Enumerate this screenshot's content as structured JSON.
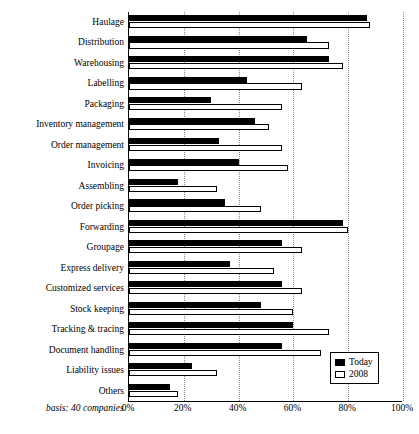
{
  "chart_data": {
    "type": "bar",
    "orientation": "horizontal",
    "title": "",
    "xlabel": "",
    "ylabel": "",
    "xlim": [
      0,
      100
    ],
    "xticks": [
      "0%",
      "20%",
      "40%",
      "60%",
      "80%",
      "100%"
    ],
    "xtick_values": [
      0,
      20,
      40,
      60,
      80,
      100
    ],
    "grid": "vertical dotted",
    "legend_position": "bottom-right",
    "categories": [
      "Haulage",
      "Distribution",
      "Warehousing",
      "Labelling",
      "Packaging",
      "Inventory management",
      "Order management",
      "Invoicing",
      "Assembling",
      "Order picking",
      "Forwarding",
      "Groupage",
      "Express delivery",
      "Customized services",
      "Stock keeping",
      "Tracking & tracing",
      "Document handling",
      "Liability issues",
      "Others"
    ],
    "series": [
      {
        "name": "Today",
        "values": [
          87,
          65,
          73,
          43,
          30,
          46,
          33,
          40,
          18,
          35,
          78,
          56,
          37,
          56,
          48,
          60,
          56,
          23,
          15
        ]
      },
      {
        "name": "2008",
        "values": [
          88,
          73,
          78,
          63,
          56,
          51,
          56,
          58,
          32,
          48,
          80,
          63,
          53,
          63,
          60,
          73,
          70,
          32,
          18
        ]
      }
    ],
    "annotation": "basis: 40 companies"
  },
  "legend": {
    "items": [
      {
        "label": "Today",
        "swatch": "filled"
      },
      {
        "label": "2008",
        "swatch": "hollow"
      }
    ]
  },
  "colors": {
    "today": "#000000",
    "year2008": "#ffffff",
    "axis": "#000000",
    "grid": "#8a8a8a"
  }
}
